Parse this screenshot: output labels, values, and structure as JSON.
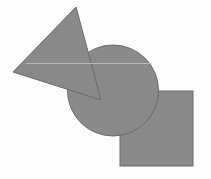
{
  "canvas": {
    "width": 211,
    "height": 179,
    "background": "#fdfdfd"
  },
  "style": {
    "fill": "#8a8a8a",
    "stroke": "#6a6a6a",
    "stroke_width": 1,
    "guide_line": "#b8b8b8"
  },
  "shapes": [
    {
      "type": "square",
      "x": 120,
      "y": 91,
      "width": 73,
      "height": 75
    },
    {
      "type": "circle",
      "cx": 113,
      "cy": 90.5,
      "r": 45.5
    },
    {
      "type": "triangle",
      "points": "76,7 13,72 101,100"
    }
  ],
  "guide_line": {
    "x1": 26,
    "y1": 63.5,
    "x2": 151,
    "y2": 63.5
  }
}
